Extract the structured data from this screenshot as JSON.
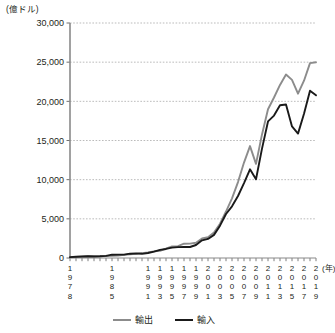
{
  "chart_data": {
    "type": "line",
    "title": "",
    "unit_label": "(億ドル)",
    "xlabel": "(年)",
    "ylabel": "",
    "ylim": [
      0,
      30000
    ],
    "ytick_values": [
      0,
      5000,
      10000,
      15000,
      20000,
      25000,
      30000
    ],
    "ytick_labels": [
      "0",
      "5,000",
      "10,000",
      "15,000",
      "20,000",
      "25,000",
      "30,000"
    ],
    "grid": true,
    "grid_style": "dotted-horizontal",
    "legend_position": "bottom-center",
    "x": [
      1978,
      1979,
      1980,
      1981,
      1982,
      1983,
      1984,
      1985,
      1986,
      1987,
      1988,
      1989,
      1990,
      1991,
      1992,
      1993,
      1994,
      1995,
      1996,
      1997,
      1998,
      1999,
      2000,
      2001,
      2002,
      2003,
      2004,
      2005,
      2006,
      2007,
      2008,
      2009,
      2010,
      2011,
      2012,
      2013,
      2014,
      2015,
      2016,
      2017,
      2018,
      2019
    ],
    "xtick_labels": [
      "1978",
      "1985",
      "1991",
      "1993",
      "1995",
      "1997",
      "1999",
      "2001",
      "2003",
      "2005",
      "2007",
      "2009",
      "2011",
      "2013",
      "2015",
      "2017",
      "2019"
    ],
    "series": [
      {
        "name": "輸出",
        "color": "#8c8c8c",
        "values": [
          98,
          137,
          181,
          220,
          223,
          222,
          261,
          274,
          309,
          394,
          475,
          525,
          621,
          719,
          849,
          917,
          1210,
          1488,
          1511,
          1828,
          1837,
          1949,
          2492,
          2661,
          3256,
          4382,
          5933,
          7620,
          9690,
          12180,
          14285,
          12016,
          15778,
          18986,
          20487,
          22090,
          23423,
          22735,
          20976,
          22635,
          24874,
          24984
        ]
      },
      {
        "name": "輸入",
        "color": "#1a1a1a",
        "values": [
          109,
          156,
          200,
          220,
          192,
          214,
          274,
          423,
          429,
          432,
          552,
          591,
          534,
          638,
          806,
          1040,
          1156,
          1321,
          1388,
          1424,
          1402,
          1657,
          2251,
          2436,
          2952,
          4128,
          5612,
          6600,
          7915,
          9560,
          11326,
          10059,
          13962,
          17435,
          18184,
          19500,
          19592,
          16796,
          15879,
          18410,
          21356,
          20769
        ]
      }
    ],
    "annotations": []
  },
  "legend": {
    "items": [
      {
        "label": "輸出",
        "color": "#8c8c8c"
      },
      {
        "label": "輸入",
        "color": "#1a1a1a"
      }
    ]
  },
  "axis": {
    "unit": "(億ドル)",
    "year_suffix": "(年)"
  }
}
